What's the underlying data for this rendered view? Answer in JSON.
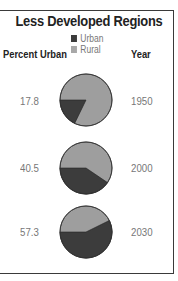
{
  "title": "Less Developed Regions",
  "legend": [
    {
      "label": "Urban",
      "color": "#3c3c3c"
    },
    {
      "label": "Rural",
      "color": "#9e9e9e"
    }
  ],
  "headers": {
    "left": "Percent Urban",
    "right": "Year"
  },
  "rows": [
    {
      "percent": "17.8",
      "year": "1950"
    },
    {
      "percent": "40.5",
      "year": "2000"
    },
    {
      "percent": "57.3",
      "year": "2030"
    }
  ],
  "chart_data": {
    "type": "pie",
    "title": "Less Developed Regions",
    "legend": [
      "Urban",
      "Rural"
    ],
    "legend_position": "top-center",
    "categories": [
      "1950",
      "2000",
      "2030"
    ],
    "series": [
      {
        "name": "Urban",
        "values": [
          17.8,
          40.5,
          57.3
        ]
      },
      {
        "name": "Rural",
        "values": [
          82.2,
          59.5,
          42.7
        ]
      }
    ],
    "colors": {
      "Urban": "#3c3c3c",
      "Rural": "#9e9e9e"
    },
    "xlabel": "Year",
    "ylabel": "Percent Urban"
  }
}
